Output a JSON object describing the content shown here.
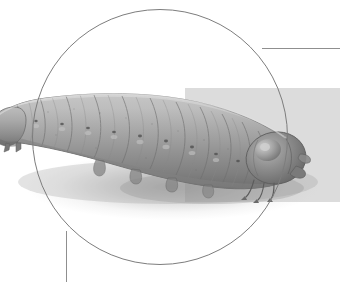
{
  "figure": {
    "style": "grayscale photo illustration",
    "caption": ""
  },
  "frame": {
    "shape": "circle",
    "center_x": 160,
    "center_y": 137,
    "radius": 128,
    "stroke_color": "#7d7d7d",
    "stroke_width": 1.2
  },
  "accents": {
    "panel": {
      "name": "gray-panel",
      "color": "#dcdcdc",
      "x": 185,
      "y": 88,
      "width": 155,
      "height": 114
    },
    "horizontal_rule": {
      "name": "horizontal-rule",
      "color": "#8f8f8f",
      "x": 262,
      "y": 48,
      "length": 78
    },
    "vertical_rule": {
      "name": "vertical-rule",
      "color": "#8f8f8f",
      "x": 66,
      "y": 231,
      "length": 51
    }
  },
  "specimen": {
    "body_color_light": "#b9b9b9",
    "body_color_mid": "#9a9a9a",
    "body_color_dark": "#6f6f6f",
    "head_color": "#7a7a7a",
    "shadow_color": "#8c8c8c",
    "orientation": "head-right",
    "segment_count": 13,
    "leg_count": 6,
    "proleg_count": 5
  },
  "background": {
    "color": "#ffffff"
  }
}
